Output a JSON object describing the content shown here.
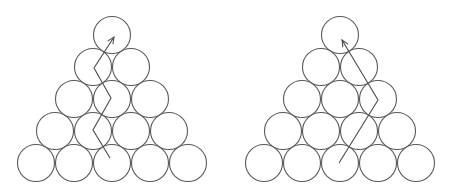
{
  "diagram": {
    "colors": {
      "stroke": "#5a5a5a",
      "arrow": "#4a4a4a",
      "background": "#ffffff"
    },
    "circle_radius": 18.5,
    "row_pitch_y": 32,
    "col_pitch_x": 38,
    "panels": [
      {
        "id": "left",
        "apex": {
          "x": 112,
          "y": 35
        },
        "rows": [
          1,
          2,
          3,
          4,
          5
        ],
        "path_description": "zigzag path",
        "path_points": [
          [
            110,
            158
          ],
          [
            93,
            130
          ],
          [
            111,
            98
          ],
          [
            94,
            68
          ],
          [
            114,
            37
          ]
        ]
      },
      {
        "id": "right",
        "apex": {
          "x": 340,
          "y": 35
        },
        "rows": [
          1,
          2,
          3,
          4,
          5
        ],
        "path_description": "two-segment path with one bend",
        "path_points": [
          [
            339,
            163
          ],
          [
            378,
            100
          ],
          [
            342,
            40
          ]
        ]
      }
    ]
  }
}
